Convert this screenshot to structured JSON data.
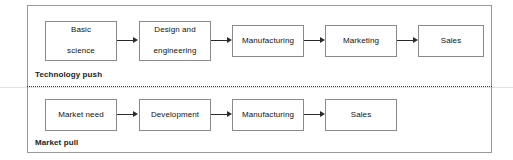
{
  "diagram": {
    "title_present": false,
    "frame": {
      "border_color": "#9a9a9a"
    },
    "divider": {
      "style": "dotted",
      "color": "#3a3a3a"
    },
    "sections": [
      {
        "id": "technology-push",
        "label": "Technology push",
        "nodes": [
          {
            "id": "basic-science",
            "label": "Basic\nscience",
            "line1": "Basic",
            "line2": "science",
            "x": 45,
            "y": 21,
            "w": 72,
            "h": 40
          },
          {
            "id": "design-and-engineering",
            "label": "Design and engineering",
            "line1": "Design and",
            "line2": "engineering",
            "x": 139,
            "y": 21,
            "w": 72,
            "h": 40
          },
          {
            "id": "manufacturing-top",
            "label": "Manufacturing",
            "line1": "Manufacturing",
            "line2": "",
            "x": 232,
            "y": 25,
            "w": 72,
            "h": 32
          },
          {
            "id": "marketing",
            "label": "Marketing",
            "line1": "Marketing",
            "line2": "",
            "x": 325,
            "y": 25,
            "w": 72,
            "h": 32
          },
          {
            "id": "sales-top",
            "label": "Sales",
            "line1": "Sales",
            "line2": "",
            "x": 418,
            "y": 25,
            "w": 66,
            "h": 32
          }
        ],
        "arrows": [
          {
            "id": "arrow-basic-to-design",
            "from": "basic-science",
            "to": "design-and-engineering"
          },
          {
            "id": "arrow-design-to-manufacturing",
            "from": "design-and-engineering",
            "to": "manufacturing-top"
          },
          {
            "id": "arrow-manufacturing-to-marketing",
            "from": "manufacturing-top",
            "to": "marketing"
          },
          {
            "id": "arrow-marketing-to-sales",
            "from": "marketing",
            "to": "sales-top"
          }
        ]
      },
      {
        "id": "market-pull",
        "label": "Market pull",
        "nodes": [
          {
            "id": "market-need",
            "label": "Market need",
            "line1": "Market need",
            "line2": "",
            "x": 45,
            "y": 99,
            "w": 72,
            "h": 32
          },
          {
            "id": "development",
            "label": "Development",
            "line1": "Development",
            "line2": "",
            "x": 139,
            "y": 99,
            "w": 72,
            "h": 32
          },
          {
            "id": "manufacturing-bottom",
            "label": "Manufacturing",
            "line1": "Manufacturing",
            "line2": "",
            "x": 232,
            "y": 99,
            "w": 72,
            "h": 32
          },
          {
            "id": "sales-bottom",
            "label": "Sales",
            "line1": "Sales",
            "line2": "",
            "x": 325,
            "y": 99,
            "w": 72,
            "h": 32
          }
        ],
        "arrows": [
          {
            "id": "arrow-need-to-development",
            "from": "market-need",
            "to": "development"
          },
          {
            "id": "arrow-development-to-manufacturing",
            "from": "development",
            "to": "manufacturing-bottom"
          },
          {
            "id": "arrow-manufacturing-to-sales",
            "from": "manufacturing-bottom",
            "to": "sales-bottom"
          }
        ]
      }
    ]
  }
}
